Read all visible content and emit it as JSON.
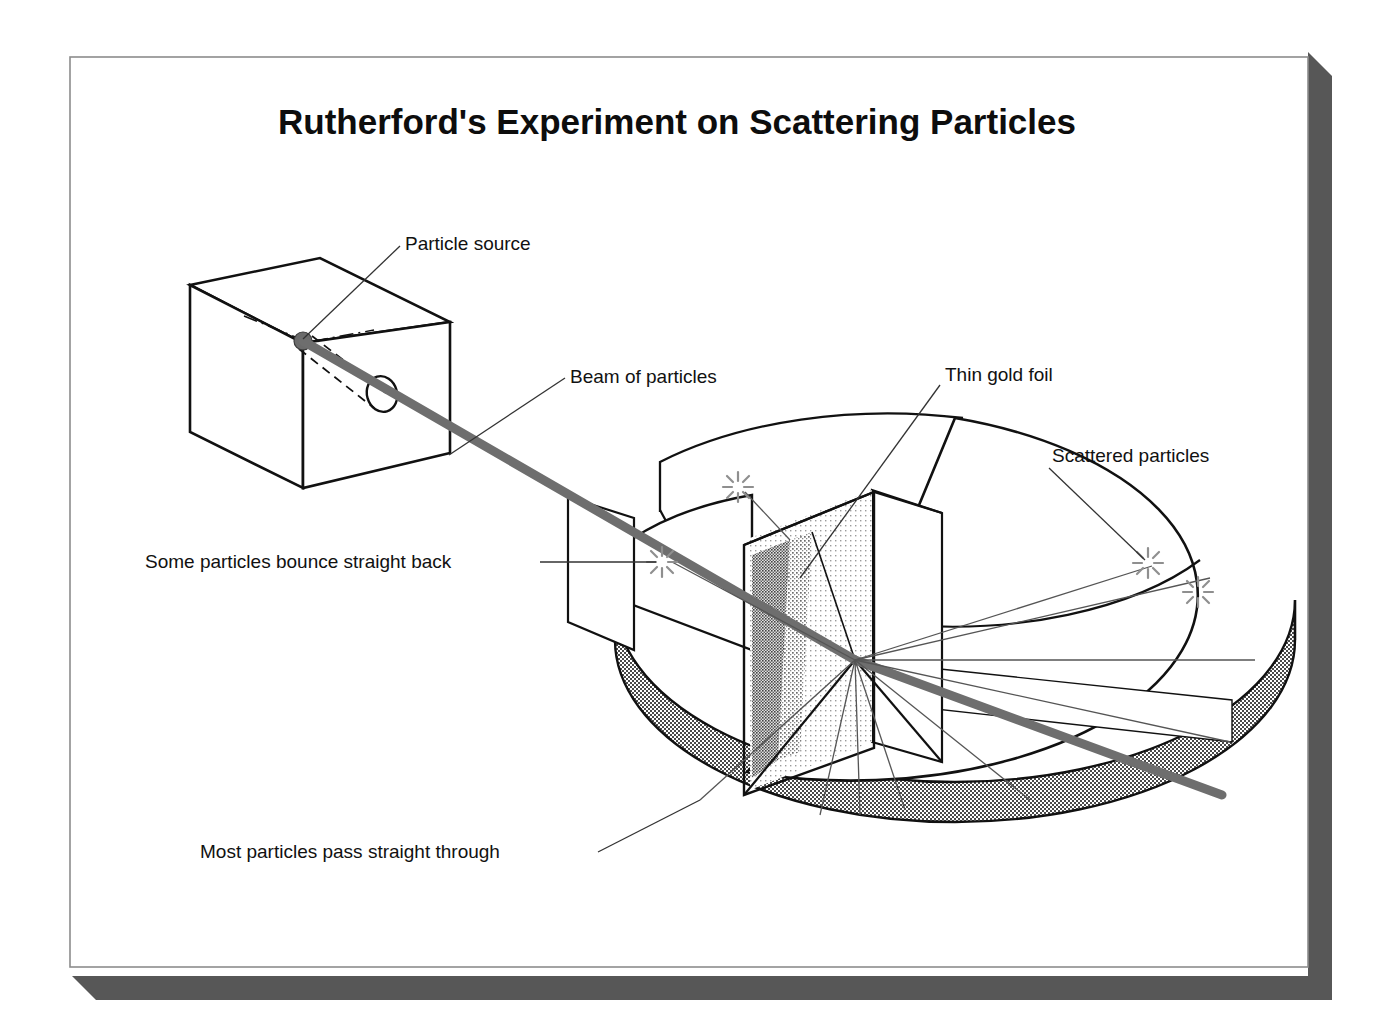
{
  "figure": {
    "title": "Rutherford's Experiment on Scattering Particles",
    "kind": "scientific-diagram"
  },
  "colors": {
    "page_background": "#ffffff",
    "frame_border": "#8c8c8c",
    "frame_fill": "#ffffff",
    "drop_shadow": "#575757",
    "ink": "#111111",
    "beam": "#6e6e6e",
    "ray_line": "#555555",
    "flash": "#8f8f8f",
    "foil_light": "#e8e8e8",
    "foil_dark": "#9a9a9a",
    "drum_wall": "#8d8d8d",
    "source_dot": "#6b6b6b"
  },
  "labels": [
    {
      "id": "particle-source",
      "text": "Particle source",
      "x": 405,
      "y": 250,
      "anchor": "start"
    },
    {
      "id": "beam-of-particles",
      "text": "Beam of particles",
      "x": 570,
      "y": 383,
      "anchor": "start"
    },
    {
      "id": "thin-gold-foil",
      "text": "Thin gold foil",
      "x": 945,
      "y": 381,
      "anchor": "start"
    },
    {
      "id": "scattered-particles",
      "text": "Scattered particles",
      "x": 1052,
      "y": 462,
      "anchor": "start"
    },
    {
      "id": "bounce-back",
      "text": "Some particles bounce straight back",
      "x": 145,
      "y": 568,
      "anchor": "start"
    },
    {
      "id": "pass-through",
      "text": "Most particles pass straight through",
      "x": 200,
      "y": 858,
      "anchor": "start"
    }
  ],
  "leader_lines": [
    {
      "id": "leader-particle-source",
      "points": "400,246 303,339"
    },
    {
      "id": "leader-beam",
      "points": "565,378 449,455"
    },
    {
      "id": "leader-thin-gold-foil",
      "points": "940,385 800,578"
    },
    {
      "id": "leader-scattered-particles",
      "points": "1049,468 1145,560"
    },
    {
      "id": "leader-bounce-back",
      "points": "540,562 656,562"
    },
    {
      "id": "leader-pass-through",
      "points": "598,852 700,800"
    }
  ],
  "parts": {
    "source_box_label": "lead shield box",
    "beam_label": "collimated particle beam",
    "drum_label": "circular detector screen drum",
    "foil_label": "thin gold foil sheet",
    "flash_count": 3,
    "scatter_ray_count": 9
  }
}
